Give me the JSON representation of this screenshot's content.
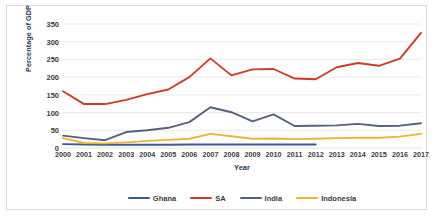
{
  "chart_data": {
    "type": "line",
    "title": "",
    "xlabel": "Year",
    "ylabel": "Percentage of GDP",
    "categories": [
      "2000",
      "2001",
      "2002",
      "2003",
      "2004",
      "2005",
      "2006",
      "2007",
      "2008",
      "2009",
      "2010",
      "2011",
      "2012",
      "2013",
      "2014",
      "2015",
      "2016",
      "2017"
    ],
    "x": [
      2000,
      2001,
      2002,
      2003,
      2004,
      2005,
      2006,
      2007,
      2008,
      2009,
      2010,
      2011,
      2012,
      2013,
      2014,
      2015,
      2016,
      2017
    ],
    "ylim": [
      0,
      350
    ],
    "yticks": [
      0,
      50,
      100,
      150,
      200,
      250,
      300,
      350
    ],
    "grid": "horizontal",
    "legend_position": "bottom",
    "series": [
      {
        "name": "Ghana",
        "color": "#3b5a9a",
        "values": [
          11,
          10,
          9,
          9,
          9,
          9,
          10,
          10,
          10,
          10,
          10,
          10,
          10,
          null,
          null,
          null,
          null,
          null
        ]
      },
      {
        "name": "SA",
        "color": "#cc3c27",
        "values": [
          160,
          124,
          124,
          136,
          152,
          165,
          200,
          253,
          205,
          222,
          223,
          196,
          194,
          228,
          240,
          232,
          252,
          325
        ]
      },
      {
        "name": "India",
        "color": "#56617c",
        "values": [
          35,
          28,
          22,
          45,
          50,
          57,
          73,
          115,
          101,
          75,
          95,
          62,
          63,
          64,
          68,
          62,
          63,
          70
        ]
      },
      {
        "name": "Indonesia",
        "color": "#eeb436",
        "values": [
          28,
          14,
          13,
          16,
          20,
          23,
          26,
          40,
          33,
          26,
          27,
          25,
          26,
          28,
          29,
          29,
          32,
          40
        ]
      }
    ]
  },
  "legend": {
    "items": [
      {
        "label": "Ghana",
        "color": "#3b5a9a"
      },
      {
        "label": "SA",
        "color": "#cc3c27"
      },
      {
        "label": "India",
        "color": "#56617c"
      },
      {
        "label": "Indonesia",
        "color": "#eeb436"
      }
    ]
  },
  "axes": {
    "y_title": "Percentage of GDP",
    "x_title": "Year",
    "y_tick_labels": [
      "350",
      "300",
      "250",
      "200",
      "150",
      "100",
      "50",
      "0"
    ],
    "x_tick_labels": [
      "2000",
      "2001",
      "2002",
      "2003",
      "2004",
      "2005",
      "2006",
      "2007",
      "2008",
      "2009",
      "2010",
      "2011",
      "2012",
      "2013",
      "2014",
      "2015",
      "2016",
      "2017"
    ]
  },
  "style": {
    "gridline_color": "#e4e4e4",
    "frame_color": "#d9d9d9",
    "text_color": "#3b3b3b",
    "axis_title_color": "#2b3a52",
    "background": "#ffffff"
  }
}
